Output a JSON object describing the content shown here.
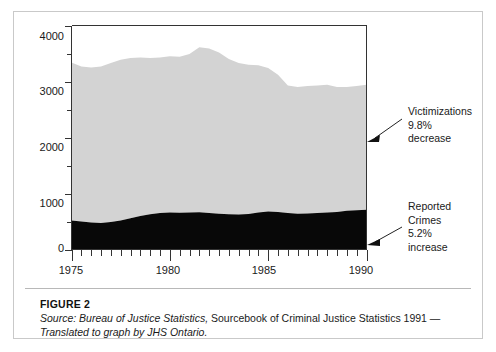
{
  "figure": {
    "caption_title": "FIGURE 2",
    "caption_source_line1_italic": "Source: Bureau of Justice Statistics,",
    "caption_source_line1_roman": " Sourcebook of Criminal Justice Statistics 1991 —",
    "caption_source_line2": "Translated to graph by JHS Ontario."
  },
  "annotations": {
    "victimizations": "Victimizations\n9.8%\ndecrease",
    "reported_crimes": "Reported\nCrimes\n5.2%\nincrease"
  },
  "colors": {
    "victimizations_fill": "#d3d3d3",
    "reported_crimes_fill": "#080808",
    "axis": "#333333",
    "figure_border": "#c9c9c9",
    "caption_divider": "#b8b8b8"
  },
  "chart_data": {
    "type": "area",
    "stacked": true,
    "title": "",
    "xlabel": "",
    "ylabel": "",
    "xlim": [
      1975,
      1990
    ],
    "ylim": [
      0,
      4000
    ],
    "grid": false,
    "legend": "none",
    "y_major_ticks": [
      0,
      1000,
      2000,
      3000,
      4000
    ],
    "y_minor_ticks": [
      500,
      1500,
      2500,
      3500
    ],
    "y_tick_labels": [
      "0",
      "1000",
      "2000",
      "3000",
      "4000"
    ],
    "x_major_ticks": [
      1975,
      1980,
      1985,
      1990
    ],
    "x_tick_labels": [
      "1975",
      "1980",
      "1985",
      "1990"
    ],
    "x_minor_tick_interval": 0.5,
    "x": [
      1975,
      1975.5,
      1976,
      1976.5,
      1977,
      1977.5,
      1978,
      1978.5,
      1979,
      1979.5,
      1980,
      1980.5,
      1981,
      1981.5,
      1982,
      1982.5,
      1983,
      1983.5,
      1984,
      1984.5,
      1985,
      1985.5,
      1986,
      1986.5,
      1987,
      1987.5,
      1988,
      1988.5,
      1989,
      1989.5,
      1990
    ],
    "series": [
      {
        "name": "Reported Crimes",
        "color": "#080808",
        "values": [
          520,
          500,
          480,
          475,
          490,
          520,
          560,
          600,
          630,
          650,
          660,
          655,
          660,
          665,
          650,
          640,
          630,
          625,
          635,
          660,
          680,
          670,
          650,
          640,
          645,
          650,
          660,
          670,
          690,
          700,
          710
        ],
        "annotation": "5.2% increase"
      },
      {
        "name": "Victimizations",
        "color": "#d3d3d3",
        "values": [
          3340,
          3270,
          3250,
          3270,
          3330,
          3390,
          3420,
          3430,
          3420,
          3430,
          3450,
          3440,
          3490,
          3610,
          3590,
          3520,
          3400,
          3330,
          3300,
          3290,
          3240,
          3120,
          2930,
          2900,
          2920,
          2930,
          2940,
          2900,
          2900,
          2920,
          2940
        ],
        "annotation": "9.8% decrease",
        "note": "values are the stacked total (top of gray band)"
      }
    ]
  }
}
